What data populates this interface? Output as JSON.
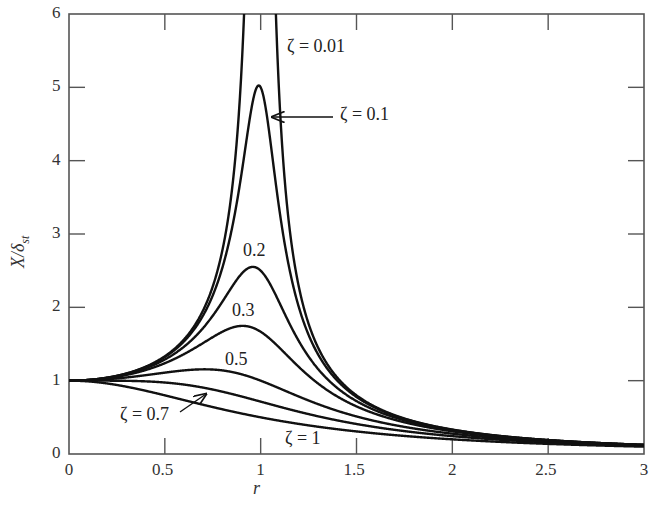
{
  "chart_data": {
    "type": "line",
    "title": "",
    "xlabel": "r",
    "ylabel": "X/δst",
    "xlim": [
      0,
      3
    ],
    "ylim": [
      0,
      6
    ],
    "x_ticks": [
      "0",
      "0.5",
      "1",
      "1.5",
      "2",
      "2.5",
      "3"
    ],
    "y_ticks": [
      "0",
      "1",
      "2",
      "3",
      "4",
      "5",
      "6"
    ],
    "grid": false,
    "formula": "X/δst = 1/sqrt((1-r^2)^2 + (2ζr)^2)",
    "series": [
      {
        "name": "ζ = 0.01",
        "zeta": 0.01,
        "peak": "exceeds 6 near r = 1"
      },
      {
        "name": "ζ = 0.1",
        "zeta": 0.1,
        "peak": 5.0
      },
      {
        "name": "0.2",
        "zeta": 0.2,
        "peak": 2.55
      },
      {
        "name": "0.3",
        "zeta": 0.3,
        "peak": 1.75
      },
      {
        "name": "0.5",
        "zeta": 0.5,
        "peak": 1.15
      },
      {
        "name": "ζ = 0.7",
        "zeta": 0.7,
        "peak": 1.0
      },
      {
        "name": "ζ = 1",
        "zeta": 1.0,
        "peak": 1.0
      }
    ],
    "sample_points": {
      "r": [
        0,
        0.5,
        1,
        1.5,
        2,
        2.5,
        3
      ],
      "zeta_0.1": [
        1.0,
        1.32,
        5.0,
        0.78,
        0.33,
        0.19,
        0.12
      ],
      "zeta_0.2": [
        1.0,
        1.29,
        2.5,
        0.74,
        0.32,
        0.19,
        0.12
      ],
      "zeta_0.3": [
        1.0,
        1.24,
        1.67,
        0.68,
        0.31,
        0.19,
        0.12
      ],
      "zeta_0.5": [
        1.0,
        1.11,
        1.0,
        0.55,
        0.28,
        0.18,
        0.12
      ],
      "zeta_0.7": [
        1.0,
        0.95,
        0.71,
        0.44,
        0.25,
        0.16,
        0.11
      ],
      "zeta_1": [
        1.0,
        0.8,
        0.5,
        0.31,
        0.2,
        0.14,
        0.1
      ]
    }
  },
  "labels": {
    "ylabel_main": "X/δ",
    "ylabel_sub": "st",
    "xlabel": "r",
    "z001": "ζ = 0.01",
    "z01": "ζ = 0.1",
    "z02": "0.2",
    "z03": "0.3",
    "z05": "0.5",
    "z07": "ζ = 0.7",
    "z1": "ζ = 1"
  },
  "ticks": {
    "x": [
      "0",
      "0.5",
      "1",
      "1.5",
      "2",
      "2.5",
      "3"
    ],
    "y": [
      "0",
      "1",
      "2",
      "3",
      "4",
      "5",
      "6"
    ]
  }
}
